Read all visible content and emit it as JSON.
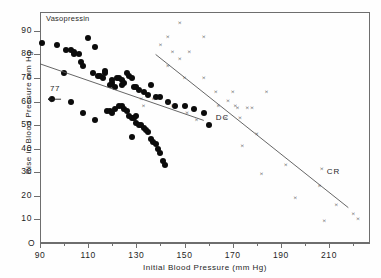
{
  "figure": {
    "top_caption": "",
    "series_label": "Vasopressin",
    "annotation_77": "77",
    "origin_label": "O",
    "fit_label_dc": "DC",
    "fit_label_cr": "CR"
  },
  "chart_data": {
    "type": "scatter",
    "title": "",
    "xlabel": "Initial  Blood  Pressure  (mm Hg)",
    "ylabel": "Rise in Blood  Pressure  mm  Hg",
    "xlim": [
      90,
      227
    ],
    "ylim": [
      0,
      98
    ],
    "xticks": [
      90,
      110,
      130,
      150,
      170,
      190,
      210
    ],
    "xticks_minor": [
      100,
      120,
      140,
      160,
      180,
      200,
      220
    ],
    "yticks": [
      10,
      20,
      30,
      40,
      50,
      60,
      70,
      80,
      90
    ],
    "grid": false,
    "legend": "none",
    "annotations": [
      {
        "text": "Vasopressin",
        "x": 92,
        "y": 96,
        "note": "series label inside panel, top-left"
      },
      {
        "text": "77",
        "x": 93,
        "y": 64,
        "note": "arrow points left to dot at (95,61)"
      },
      {
        "text": "DC",
        "x": 163,
        "y": 53,
        "note": "label for lower regression line"
      },
      {
        "text": "CR",
        "x": 209,
        "y": 30,
        "note": "label for upper/right regression line"
      }
    ],
    "fit_lines": [
      {
        "name": "DC",
        "x": [
          90,
          158
        ],
        "y": [
          76,
          52
        ],
        "style": "solid",
        "color": "#555555"
      },
      {
        "name": "CR",
        "x": [
          138,
          218
        ],
        "y": [
          80,
          15
        ],
        "style": "solid",
        "color": "#555555"
      }
    ],
    "series": [
      {
        "name": "Vasopressin",
        "marker": "filled-circle",
        "color": "#0b0b0b",
        "points": [
          [
            91,
            85
          ],
          [
            97,
            84
          ],
          [
            101,
            82
          ],
          [
            103,
            82
          ],
          [
            104,
            81
          ],
          [
            104,
            80
          ],
          [
            106,
            80
          ],
          [
            110,
            87
          ],
          [
            113,
            83
          ],
          [
            107,
            77
          ],
          [
            108,
            75
          ],
          [
            100,
            72
          ],
          [
            112,
            72
          ],
          [
            114,
            71
          ],
          [
            115,
            71
          ],
          [
            116,
            70
          ],
          [
            117,
            73
          ],
          [
            117,
            72
          ],
          [
            120,
            69
          ],
          [
            120,
            68
          ],
          [
            119,
            67
          ],
          [
            121,
            66
          ],
          [
            122,
            70
          ],
          [
            123,
            70
          ],
          [
            124,
            69
          ],
          [
            124,
            67
          ],
          [
            125,
            68
          ],
          [
            126,
            72
          ],
          [
            127,
            71
          ],
          [
            128,
            70
          ],
          [
            129,
            66
          ],
          [
            130,
            66
          ],
          [
            131,
            65
          ],
          [
            133,
            64
          ],
          [
            135,
            63
          ],
          [
            136,
            67
          ],
          [
            138,
            62
          ],
          [
            140,
            62
          ],
          [
            143,
            60
          ],
          [
            146,
            58
          ],
          [
            150,
            58
          ],
          [
            154,
            57
          ],
          [
            158,
            55
          ],
          [
            160,
            50
          ],
          [
            95,
            61
          ],
          [
            103,
            60
          ],
          [
            108,
            55
          ],
          [
            113,
            52
          ],
          [
            118,
            56
          ],
          [
            119,
            56
          ],
          [
            120,
            55
          ],
          [
            121,
            57
          ],
          [
            123,
            58
          ],
          [
            124,
            58
          ],
          [
            125,
            57
          ],
          [
            126,
            56
          ],
          [
            127,
            54
          ],
          [
            128,
            53
          ],
          [
            129,
            53
          ],
          [
            130,
            54
          ],
          [
            130,
            51
          ],
          [
            131,
            50
          ],
          [
            132,
            50
          ],
          [
            133,
            49
          ],
          [
            134,
            48
          ],
          [
            135,
            47
          ],
          [
            128,
            45
          ],
          [
            136,
            44
          ],
          [
            137,
            43
          ],
          [
            138,
            42
          ],
          [
            139,
            40
          ],
          [
            140,
            38
          ],
          [
            141,
            35
          ],
          [
            142,
            33
          ]
        ]
      },
      {
        "name": "Control",
        "marker": "x",
        "color": "#2a2a2a",
        "points": [
          [
            148,
            93
          ],
          [
            143,
            87
          ],
          [
            158,
            87
          ],
          [
            140,
            84
          ],
          [
            145,
            81
          ],
          [
            152,
            81
          ],
          [
            148,
            78
          ],
          [
            143,
            75
          ],
          [
            150,
            70
          ],
          [
            158,
            70
          ],
          [
            163,
            64
          ],
          [
            170,
            64
          ],
          [
            184,
            64
          ],
          [
            132,
            61
          ],
          [
            137,
            61
          ],
          [
            133,
            58
          ],
          [
            143,
            59
          ],
          [
            145,
            58
          ],
          [
            164,
            58
          ],
          [
            151,
            55
          ],
          [
            155,
            52
          ],
          [
            168,
            60
          ],
          [
            171,
            58
          ],
          [
            172,
            57
          ],
          [
            176,
            57
          ],
          [
            178,
            57
          ],
          [
            167,
            53
          ],
          [
            173,
            53
          ],
          [
            180,
            46
          ],
          [
            174,
            41
          ],
          [
            192,
            33
          ],
          [
            182,
            29
          ],
          [
            207,
            31
          ],
          [
            206,
            24
          ],
          [
            196,
            19
          ],
          [
            213,
            16
          ],
          [
            220,
            12
          ],
          [
            222,
            10
          ],
          [
            208,
            9
          ]
        ]
      }
    ]
  }
}
